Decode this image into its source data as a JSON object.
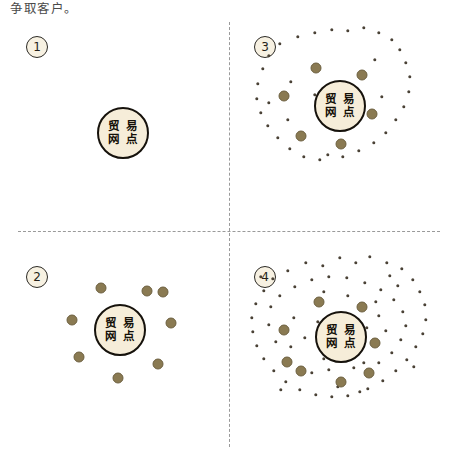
{
  "caption": {
    "text": "争取客户。"
  },
  "colors": {
    "background": "#ffffff",
    "node_fill": "#f6edd9",
    "node_border": "#16120c",
    "medium_dot": "#8a7a52",
    "small_dot": "#4a4236",
    "divider": "#9a9a9a",
    "badge_fill": "#f7f1e2",
    "badge_border": "#2c2a25",
    "caption_text": "#4a4a4a"
  },
  "node": {
    "line1": "贸 易",
    "line2": "网 点"
  },
  "panels": [
    {
      "id": "panel-1",
      "number": "1",
      "quadrant": "top-left",
      "node_center": [
        123,
        133
      ],
      "medium_dots": [],
      "small_dots": []
    },
    {
      "id": "panel-2",
      "number": "2",
      "quadrant": "bottom-left",
      "node_center": [
        120,
        100
      ],
      "medium_dots": [
        [
          101,
          58
        ],
        [
          147,
          61
        ],
        [
          171,
          93
        ],
        [
          158,
          134
        ],
        [
          118,
          148
        ],
        [
          79,
          127
        ],
        [
          72,
          90
        ],
        [
          163,
          62
        ]
      ],
      "small_dots": []
    },
    {
      "id": "panel-3",
      "number": "3",
      "quadrant": "top-right",
      "node_center": [
        112,
        106
      ],
      "medium_dots": [
        [
          88,
          68
        ],
        [
          134,
          75
        ],
        [
          56,
          96
        ],
        [
          144,
          114
        ],
        [
          73,
          136
        ],
        [
          113,
          144
        ]
      ],
      "small_dots": [
        [
          70,
          37
        ],
        [
          87,
          33
        ],
        [
          104,
          30
        ],
        [
          120,
          31
        ],
        [
          136,
          28
        ],
        [
          151,
          33
        ],
        [
          164,
          40
        ],
        [
          52,
          44
        ],
        [
          41,
          56
        ],
        [
          35,
          69
        ],
        [
          172,
          50
        ],
        [
          178,
          63
        ],
        [
          182,
          77
        ],
        [
          181,
          92
        ],
        [
          176,
          107
        ],
        [
          30,
          84
        ],
        [
          29,
          99
        ],
        [
          33,
          113
        ],
        [
          40,
          126
        ],
        [
          50,
          138
        ],
        [
          168,
          120
        ],
        [
          158,
          133
        ],
        [
          146,
          143
        ],
        [
          131,
          151
        ],
        [
          115,
          157
        ],
        [
          62,
          149
        ],
        [
          76,
          157
        ],
        [
          92,
          160
        ],
        [
          100,
          155
        ],
        [
          41,
          103
        ],
        [
          63,
          82
        ],
        [
          87,
          95
        ],
        [
          99,
          118
        ],
        [
          130,
          96
        ],
        [
          121,
          124
        ],
        [
          154,
          97
        ],
        [
          147,
          60
        ],
        [
          60,
          120
        ]
      ]
    },
    {
      "id": "panel-4",
      "number": "4",
      "quadrant": "bottom-right",
      "node_center": [
        113,
        107
      ],
      "medium_dots": [
        [
          91,
          72
        ],
        [
          134,
          77
        ],
        [
          56,
          100
        ],
        [
          147,
          113
        ],
        [
          59,
          132
        ],
        [
          113,
          152
        ],
        [
          141,
          143
        ],
        [
          73,
          141
        ]
      ],
      "small_dots": [
        [
          60,
          41
        ],
        [
          78,
          33
        ],
        [
          95,
          36
        ],
        [
          112,
          28
        ],
        [
          128,
          33
        ],
        [
          142,
          27
        ],
        [
          159,
          33
        ],
        [
          174,
          39
        ],
        [
          45,
          49
        ],
        [
          36,
          61
        ],
        [
          185,
          50
        ],
        [
          192,
          62
        ],
        [
          197,
          75
        ],
        [
          198,
          90
        ],
        [
          195,
          104
        ],
        [
          28,
          74
        ],
        [
          24,
          88
        ],
        [
          25,
          102
        ],
        [
          29,
          116
        ],
        [
          36,
          129
        ],
        [
          188,
          117
        ],
        [
          179,
          130
        ],
        [
          168,
          141
        ],
        [
          155,
          151
        ],
        [
          140,
          159
        ],
        [
          46,
          141
        ],
        [
          58,
          152
        ],
        [
          72,
          160
        ],
        [
          88,
          165
        ],
        [
          104,
          167
        ],
        [
          120,
          166
        ],
        [
          132,
          162
        ],
        [
          43,
          77
        ],
        [
          52,
          66
        ],
        [
          67,
          57
        ],
        [
          84,
          50
        ],
        [
          101,
          47
        ],
        [
          119,
          48
        ],
        [
          137,
          53
        ],
        [
          153,
          60
        ],
        [
          166,
          70
        ],
        [
          175,
          82
        ],
        [
          178,
          96
        ],
        [
          173,
          110
        ],
        [
          164,
          123
        ],
        [
          151,
          133
        ],
        [
          136,
          133
        ],
        [
          96,
          62
        ],
        [
          120,
          66
        ],
        [
          151,
          86
        ],
        [
          158,
          101
        ],
        [
          66,
          88
        ],
        [
          48,
          112
        ],
        [
          63,
          117
        ],
        [
          84,
          143
        ],
        [
          101,
          140
        ],
        [
          126,
          138
        ],
        [
          148,
          72
        ],
        [
          41,
          95
        ],
        [
          90,
          92
        ],
        [
          170,
          56
        ],
        [
          33,
          47
        ],
        [
          186,
          137
        ],
        [
          53,
          160
        ],
        [
          162,
          46
        ],
        [
          110,
          157
        ],
        [
          77,
          108
        ],
        [
          96,
          129
        ],
        [
          129,
          120
        ],
        [
          139,
          98
        ]
      ]
    }
  ]
}
